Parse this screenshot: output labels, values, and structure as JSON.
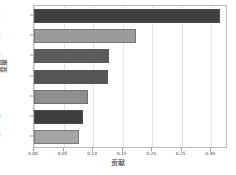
{
  "chart_data": {
    "type": "bar",
    "orientation": "horizontal",
    "title": "",
    "xlabel": "贡献",
    "ylabel": "变量",
    "categories": [
      "脂肪肝评级",
      "生活",
      "年龄",
      "收入",
      "BMI",
      "血糖",
      "护理"
    ],
    "values": [
      0.315,
      0.172,
      0.127,
      0.125,
      0.092,
      0.083,
      0.077
    ],
    "colors": [
      "#3f3f3f",
      "#9b9b9b",
      "#5c5c5c",
      "#555555",
      "#8f8f8f",
      "#3d3d3d",
      "#a5a5a5"
    ],
    "xlim": [
      0.0,
      0.325
    ],
    "ylim_categories": 7,
    "xticks": [
      0.0,
      0.05,
      0.1,
      0.15,
      0.2,
      0.25,
      0.3
    ],
    "xtick_labels": [
      "0.00",
      "0.05",
      "0.10",
      "0.15",
      "0.20",
      "0.25",
      "0.30"
    ],
    "grid": true,
    "grid_axis": "x",
    "legend": null,
    "legend_position": "none"
  },
  "figure": {
    "background_color": "#ffffff",
    "axes_edge_color": "#b9b9b9",
    "grid_color": "#e2e2e2",
    "tick_label_color": "#3b3b3b",
    "axis_title_color": "#1f1f1f"
  }
}
